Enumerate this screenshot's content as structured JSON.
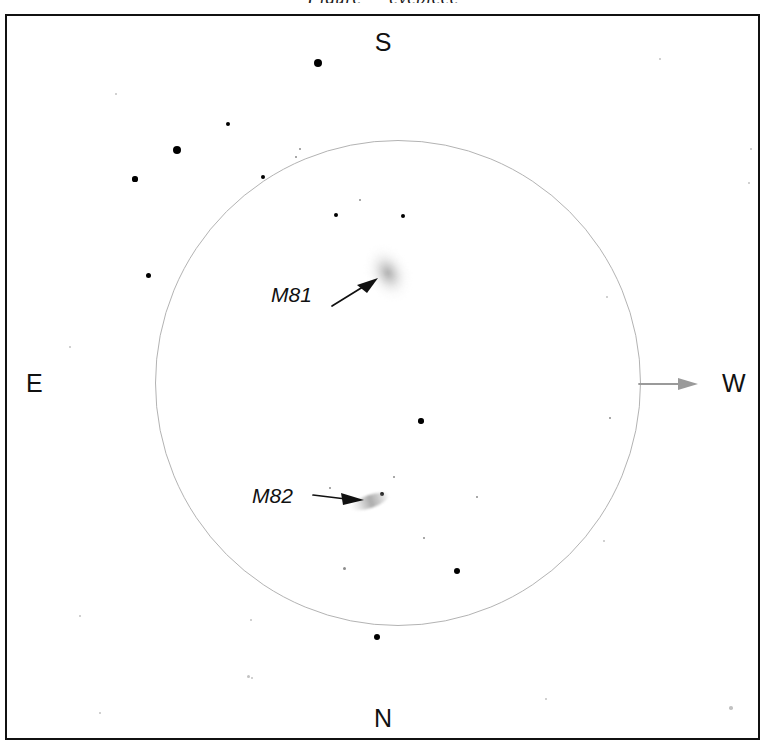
{
  "chart_data": {
    "type": "scatter",
    "xlabel": "",
    "ylabel": "",
    "grid": false,
    "legend_position": "none",
    "field_of_view": {
      "shape": "circle",
      "center_x": 398,
      "center_y": 383,
      "radius_px": 243,
      "stroke_color": "#b3b3b3"
    },
    "orientation": {
      "top": "S",
      "bottom": "N",
      "left": "E",
      "right": "W",
      "drift_direction": "W"
    },
    "deep_sky_objects": [
      {
        "name": "M81",
        "type": "galaxy",
        "morphology": "face-on spiral",
        "appearance": "diffuse oval glow",
        "x": 388,
        "y": 273,
        "size_px": [
          52,
          60
        ],
        "position_angle_deg": -28,
        "label": "M81"
      },
      {
        "name": "M82",
        "type": "galaxy",
        "morphology": "edge-on irregular",
        "appearance": "thin elongated streak",
        "x": 370,
        "y": 501,
        "size_px": [
          40,
          13
        ],
        "position_angle_deg": -19,
        "label": "M82"
      }
    ],
    "stars": [
      {
        "x": 318,
        "y": 63,
        "r": 4.0,
        "mag": "bright"
      },
      {
        "x": 228,
        "y": 124,
        "r": 2.4,
        "mag": "medium"
      },
      {
        "x": 177,
        "y": 150,
        "r": 4.4,
        "mag": "bright"
      },
      {
        "x": 135,
        "y": 179,
        "r": 2.6,
        "mag": "medium"
      },
      {
        "x": 300,
        "y": 149,
        "r": 1.3,
        "mag": "faint"
      },
      {
        "x": 296,
        "y": 157,
        "r": 1.1,
        "mag": "faint"
      },
      {
        "x": 263,
        "y": 177,
        "r": 2.4,
        "mag": "medium"
      },
      {
        "x": 360,
        "y": 200,
        "r": 1.2,
        "mag": "faint"
      },
      {
        "x": 336,
        "y": 215,
        "r": 2.1,
        "mag": "medium"
      },
      {
        "x": 403,
        "y": 216,
        "r": 2.2,
        "mag": "medium"
      },
      {
        "x": 148,
        "y": 275,
        "r": 2.5,
        "mag": "medium"
      },
      {
        "x": 421,
        "y": 421,
        "r": 2.7,
        "mag": "medium"
      },
      {
        "x": 394,
        "y": 477,
        "r": 1.2,
        "mag": "faint"
      },
      {
        "x": 382,
        "y": 494,
        "r": 2.4,
        "mag": "medium"
      },
      {
        "x": 477,
        "y": 497,
        "r": 1.4,
        "mag": "faint"
      },
      {
        "x": 330,
        "y": 488,
        "r": 1.1,
        "mag": "faint"
      },
      {
        "x": 424,
        "y": 538,
        "r": 1.3,
        "mag": "faint"
      },
      {
        "x": 344,
        "y": 568,
        "r": 1.5,
        "mag": "faint"
      },
      {
        "x": 457,
        "y": 571,
        "r": 3.1,
        "mag": "medium"
      },
      {
        "x": 377,
        "y": 637,
        "r": 3.4,
        "mag": "bright"
      },
      {
        "x": 610,
        "y": 418,
        "r": 1.3,
        "mag": "faint"
      },
      {
        "x": 604,
        "y": 541,
        "r": 1.2,
        "mag": "vfaint"
      },
      {
        "x": 660,
        "y": 59,
        "r": 1.4,
        "mag": "vfaint"
      },
      {
        "x": 751,
        "y": 149,
        "r": 1.4,
        "mag": "vfaint"
      },
      {
        "x": 749,
        "y": 183,
        "r": 1.2,
        "mag": "vfaint"
      },
      {
        "x": 116,
        "y": 94,
        "r": 1.2,
        "mag": "vfaint"
      },
      {
        "x": 248,
        "y": 676,
        "r": 1.5,
        "mag": "vfaint"
      },
      {
        "x": 252,
        "y": 678,
        "r": 1.2,
        "mag": "vfaint"
      },
      {
        "x": 100,
        "y": 713,
        "r": 1.4,
        "mag": "vfaint"
      },
      {
        "x": 546,
        "y": 699,
        "r": 1.3,
        "mag": "vfaint"
      },
      {
        "x": 731,
        "y": 708,
        "r": 1.8,
        "mag": "vfaint"
      },
      {
        "x": 607,
        "y": 297,
        "r": 1.2,
        "mag": "vfaint"
      },
      {
        "x": 80,
        "y": 616,
        "r": 1.3,
        "mag": "vfaint"
      },
      {
        "x": 251,
        "y": 620,
        "r": 1.2,
        "mag": "vfaint"
      },
      {
        "x": 70,
        "y": 347,
        "r": 1.1,
        "mag": "vfaint"
      }
    ]
  },
  "header": {
    "clipped_caption": "Figure — eyepiece"
  },
  "compass": {
    "south": "S",
    "north": "N",
    "east": "E",
    "west": "W"
  },
  "labels": {
    "m81": "M81",
    "m82": "M82"
  },
  "colors": {
    "frame": "#111111",
    "circle": "#b3b3b3",
    "star": "#000000",
    "drift_arrow": "#9a9a9a",
    "leader_arrow": "#111111",
    "background": "#ffffff"
  }
}
